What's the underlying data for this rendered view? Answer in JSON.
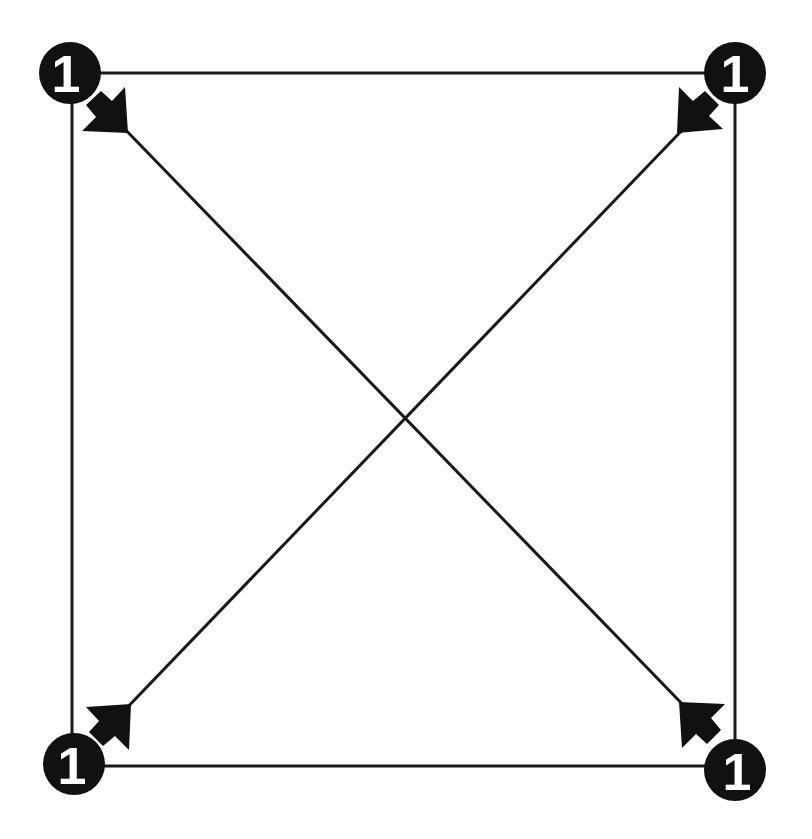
{
  "diagram": {
    "type": "complete-graph-k4",
    "nodes": [
      {
        "id": "top-left",
        "label": "1",
        "cx": 70,
        "cy": 73
      },
      {
        "id": "top-right",
        "label": "1",
        "cx": 735,
        "cy": 73
      },
      {
        "id": "bottom-left",
        "label": "1",
        "cx": 74,
        "cy": 764
      },
      {
        "id": "bottom-right",
        "label": "1",
        "cx": 735,
        "cy": 768
      }
    ],
    "edges": [
      {
        "from": "top-left",
        "to": "top-right",
        "directed": false
      },
      {
        "from": "bottom-left",
        "to": "bottom-right",
        "directed": false
      },
      {
        "from": "top-left",
        "to": "bottom-left",
        "directed": false
      },
      {
        "from": "top-right",
        "to": "bottom-right",
        "directed": false
      },
      {
        "from": "top-left",
        "to": "bottom-right",
        "directed": true,
        "arrow_at": "both-ends-pointing-inward"
      },
      {
        "from": "top-right",
        "to": "bottom-left",
        "directed": true,
        "arrow_at": "both-ends-pointing-inward"
      }
    ],
    "colors": {
      "stroke": "#1a1a1a",
      "node_fill": "#111111",
      "label": "#ffffff",
      "background": "#ffffff"
    }
  }
}
